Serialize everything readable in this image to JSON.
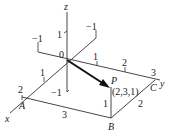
{
  "diagram": {
    "axes": {
      "x": "x",
      "y": "y",
      "z": "z",
      "origin": "0"
    },
    "ticks": {
      "z_pos": "1",
      "z_neg": "−1",
      "x_pos": "1",
      "x_pos2": "2",
      "x_neg": "−1",
      "y_pos": "1",
      "y_pos2": "2",
      "y_pos3": "3",
      "y_neg": "−1"
    },
    "points": {
      "A": "A",
      "B": "B",
      "C": "C",
      "P": "P",
      "P_coords": "(2,3,1)"
    },
    "edge_labels": {
      "AB": "3",
      "BP": "1",
      "BC": "2"
    },
    "colors": {
      "line": "#333333",
      "arrow": "#111111"
    }
  }
}
